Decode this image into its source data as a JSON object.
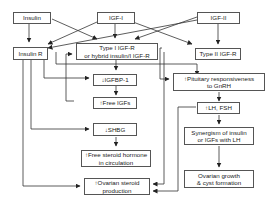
{
  "diagram": {
    "nodes": {
      "insulin": {
        "line1": "Insulin"
      },
      "igf1": {
        "line1": "IGF-I"
      },
      "igf2": {
        "line1": "IGF-II"
      },
      "insulin_r": {
        "line1": "Insulin R"
      },
      "type1_igfr": {
        "line1": "Type I IGF-R",
        "line2": "or hybrid insulin/I IGF-R"
      },
      "type2_igfr": {
        "line1": "Type II IGF-R"
      },
      "igfbp1": {
        "line1": "↓IGFBP-1"
      },
      "free_igfs": {
        "line1": "↑Free IGFs"
      },
      "shbg": {
        "line1": "↓SHBG"
      },
      "free_steroid": {
        "line1": "↑Free steroid hormone",
        "line2": "in circulation"
      },
      "ovarian_steroid": {
        "line1": "↑Ovarian steroid",
        "line2": "production"
      },
      "pituitary": {
        "line1": "↑Pituitary responsiveness",
        "line2": "to GnRH"
      },
      "lh_fsh": {
        "line1": "↑LH, FSH"
      },
      "synergism": {
        "line1": "Synergism of insulin",
        "line2": "or IGFs with LH"
      },
      "ovarian_growth": {
        "line1": "Ovarian growth",
        "line2": "& cyst formation"
      }
    },
    "colors": {
      "line": "#333333",
      "box_border": "#555555",
      "text": "#222222"
    }
  }
}
